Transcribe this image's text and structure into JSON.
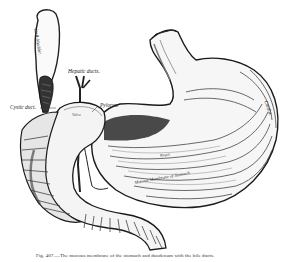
{
  "figure": {
    "caption": "Fig. 407.—The mucous membrane of the stomach and duodenum with the bile ducts.",
    "labels": {
      "gall_bladder": "Gall-bladder.",
      "hepatic_ducts": "Hepatic ducts.",
      "cystic_duct": "Cystic duct.",
      "pylorus": "Pylorus.",
      "cardia": "Cardia.",
      "mucous_membrane": "Mucous Membrane of Stomach",
      "rugae": "Rugae",
      "valve": "Valve"
    },
    "colors": {
      "ink": "#1a1a1a",
      "shade": "#555555",
      "paper": "#ffffff"
    }
  }
}
